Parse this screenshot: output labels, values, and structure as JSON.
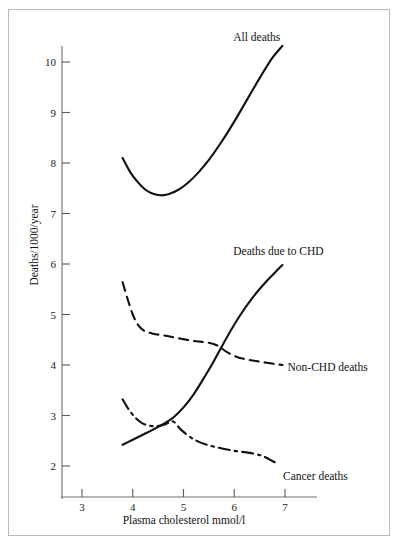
{
  "figure": {
    "background_color": "#ffffff",
    "ink_color": "#111111",
    "border_color": "#b9b9b9"
  },
  "chart_data": {
    "type": "line",
    "title": "",
    "subtitle": "",
    "xlabel": "Plasma cholesterol mmol/l",
    "ylabel": "Deaths/1000/year",
    "xlim": [
      2.62,
      7.4
    ],
    "ylim": [
      1.4,
      10.62
    ],
    "xticks": [
      3,
      4,
      5,
      6,
      7
    ],
    "xtick_labels": [
      "3",
      "4",
      "5",
      "6",
      "7"
    ],
    "yticks": [
      2,
      3,
      4,
      5,
      6,
      7,
      8,
      9,
      10
    ],
    "ytick_labels": [
      "2",
      "3",
      "4",
      "5",
      "6",
      "7",
      "8",
      "9",
      "10"
    ],
    "grid": false,
    "legend": "inline-end-of-curve",
    "series": [
      {
        "name": "All deaths",
        "linestyle": "solid",
        "label_position": "above-right-end",
        "x": [
          3.8,
          3.95,
          4.1,
          4.25,
          4.4,
          4.55,
          4.7,
          4.9,
          5.1,
          5.3,
          5.5,
          5.75,
          6.0,
          6.25,
          6.5,
          6.75,
          6.95
        ],
        "y": [
          8.1,
          7.82,
          7.62,
          7.47,
          7.39,
          7.36,
          7.38,
          7.47,
          7.62,
          7.82,
          8.06,
          8.42,
          8.82,
          9.25,
          9.68,
          10.08,
          10.32
        ]
      },
      {
        "name": "Deaths due to CHD",
        "linestyle": "solid",
        "label_position": "above-right-end",
        "x": [
          3.8,
          4.0,
          4.2,
          4.4,
          4.6,
          4.8,
          5.0,
          5.2,
          5.4,
          5.6,
          5.85,
          6.1,
          6.35,
          6.6,
          6.85,
          6.95
        ],
        "y": [
          2.42,
          2.52,
          2.62,
          2.72,
          2.83,
          2.96,
          3.16,
          3.42,
          3.74,
          4.08,
          4.54,
          4.96,
          5.32,
          5.62,
          5.88,
          5.98
        ]
      },
      {
        "name": "Non-CHD deaths",
        "linestyle": "dashed",
        "label_position": "right-of-end",
        "x": [
          3.8,
          3.9,
          4.0,
          4.1,
          4.22,
          4.4,
          4.65,
          4.95,
          5.25,
          5.5,
          5.68,
          5.85,
          6.05,
          6.3,
          6.55,
          6.8,
          6.95
        ],
        "y": [
          5.64,
          5.3,
          5.0,
          4.8,
          4.68,
          4.62,
          4.58,
          4.52,
          4.47,
          4.44,
          4.38,
          4.26,
          4.16,
          4.1,
          4.06,
          4.02,
          4.0
        ]
      },
      {
        "name": "Cancer deaths",
        "linestyle": "dash-dot",
        "label_position": "below-right-end",
        "x": [
          3.8,
          3.92,
          4.05,
          4.2,
          4.38,
          4.55,
          4.7,
          4.8,
          4.95,
          5.15,
          5.4,
          5.7,
          6.0,
          6.3,
          6.55,
          6.75,
          6.88
        ],
        "y": [
          3.32,
          3.12,
          2.96,
          2.84,
          2.79,
          2.8,
          2.85,
          2.88,
          2.72,
          2.56,
          2.44,
          2.36,
          2.3,
          2.26,
          2.2,
          2.1,
          2.03
        ]
      }
    ],
    "annotations": [
      {
        "text": "All deaths",
        "anchor_x": 5.98,
        "anchor_y": 10.62
      },
      {
        "text": "Deaths due to CHD",
        "anchor_x": 5.98,
        "anchor_y": 6.38
      },
      {
        "text": "Non-CHD deaths",
        "anchor_x": 7.05,
        "anchor_y": 4.08
      },
      {
        "text": "Cancer deaths",
        "anchor_x": 6.96,
        "anchor_y": 1.93
      }
    ]
  }
}
